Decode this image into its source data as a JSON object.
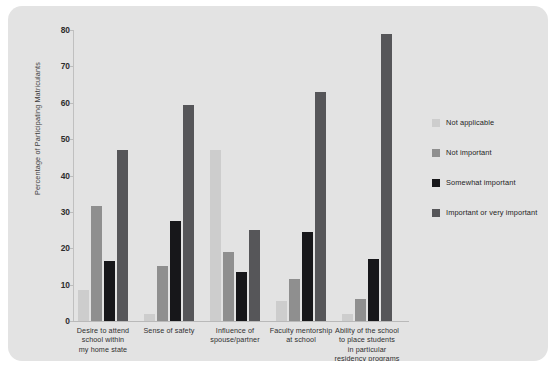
{
  "chart_data": {
    "type": "bar",
    "title": "",
    "xlabel": "",
    "ylabel": "Percentage of Participating Matriculants",
    "ylim": [
      0,
      80
    ],
    "ytick_step": 10,
    "yticks": [
      "80",
      "70",
      "60",
      "50",
      "40",
      "30",
      "20",
      "10",
      "0"
    ],
    "grid": false,
    "legend_position": "right",
    "categories": [
      "Desire to attend school within my home state",
      "Sense of safety",
      "Influence of spouse/partner",
      "Faculty mentorship at school",
      "Ability of the school to place students in particular residency programs"
    ],
    "category_lines": [
      [
        "Desire to attend",
        "school within",
        "my home state"
      ],
      [
        "Sense of safety"
      ],
      [
        "Influence of",
        "spouse/partner"
      ],
      [
        "Faculty mentorship",
        "at school"
      ],
      [
        "Ability of the school",
        "to place students",
        "in particular",
        "residency programs"
      ]
    ],
    "series": [
      {
        "name": "Not applicable",
        "color": "#cdcdcd",
        "values": [
          8.5,
          2.0,
          47.0,
          5.5,
          2.0
        ]
      },
      {
        "name": "Not important",
        "color": "#8f8f8f",
        "values": [
          31.5,
          15.0,
          19.0,
          11.5,
          6.0
        ]
      },
      {
        "name": "Somewhat important",
        "color": "#17171a",
        "values": [
          16.5,
          27.5,
          13.5,
          24.5,
          17.0
        ]
      },
      {
        "name": "Important or very important",
        "color": "#565659",
        "values": [
          47.0,
          59.5,
          25.0,
          63.0,
          79.0
        ]
      }
    ]
  },
  "panel": {
    "background": "#e3e3e3"
  }
}
